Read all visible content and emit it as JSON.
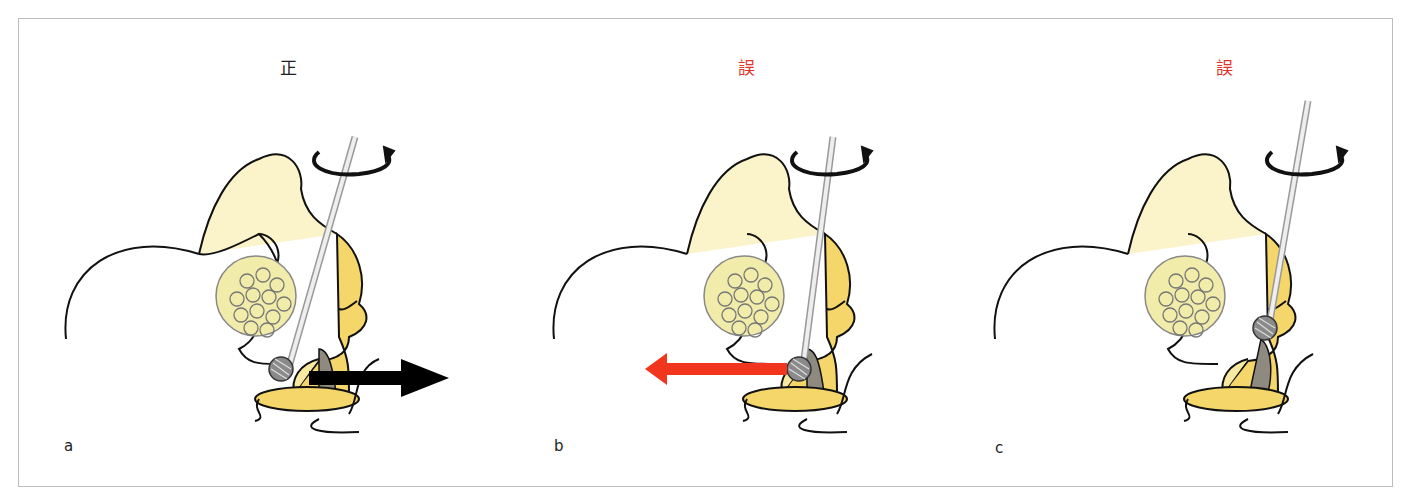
{
  "colors": {
    "correct": "#222222",
    "wrong": "#e2352a",
    "bone_fill": "#fbf3c9",
    "cartilage_fill": "#f5d66a",
    "disc_fill": "#f2ecaa",
    "burr_fill": "#8a8a8a",
    "frame": "#bdbdbd"
  },
  "panels": [
    {
      "id": "a",
      "title": "正",
      "title_color": "#222222",
      "label": "a",
      "arrow": {
        "direction": "right",
        "color": "#000000"
      },
      "burr": {
        "x": 262,
        "y": 350
      },
      "shaft_top": {
        "x": 336,
        "y": 118
      }
    },
    {
      "id": "b",
      "title": "誤",
      "title_color": "#e2352a",
      "label": "b",
      "arrow": {
        "direction": "left",
        "color": "#f2361e"
      },
      "burr": {
        "x": 322,
        "y": 350
      },
      "shaft_top": {
        "x": 356,
        "y": 118
      }
    },
    {
      "id": "c",
      "title": "誤",
      "title_color": "#e2352a",
      "label": "c",
      "arrow": {
        "direction": "none",
        "color": ""
      },
      "burr": {
        "x": 330,
        "y": 309
      },
      "shaft_top": {
        "x": 373,
        "y": 82
      }
    }
  ]
}
